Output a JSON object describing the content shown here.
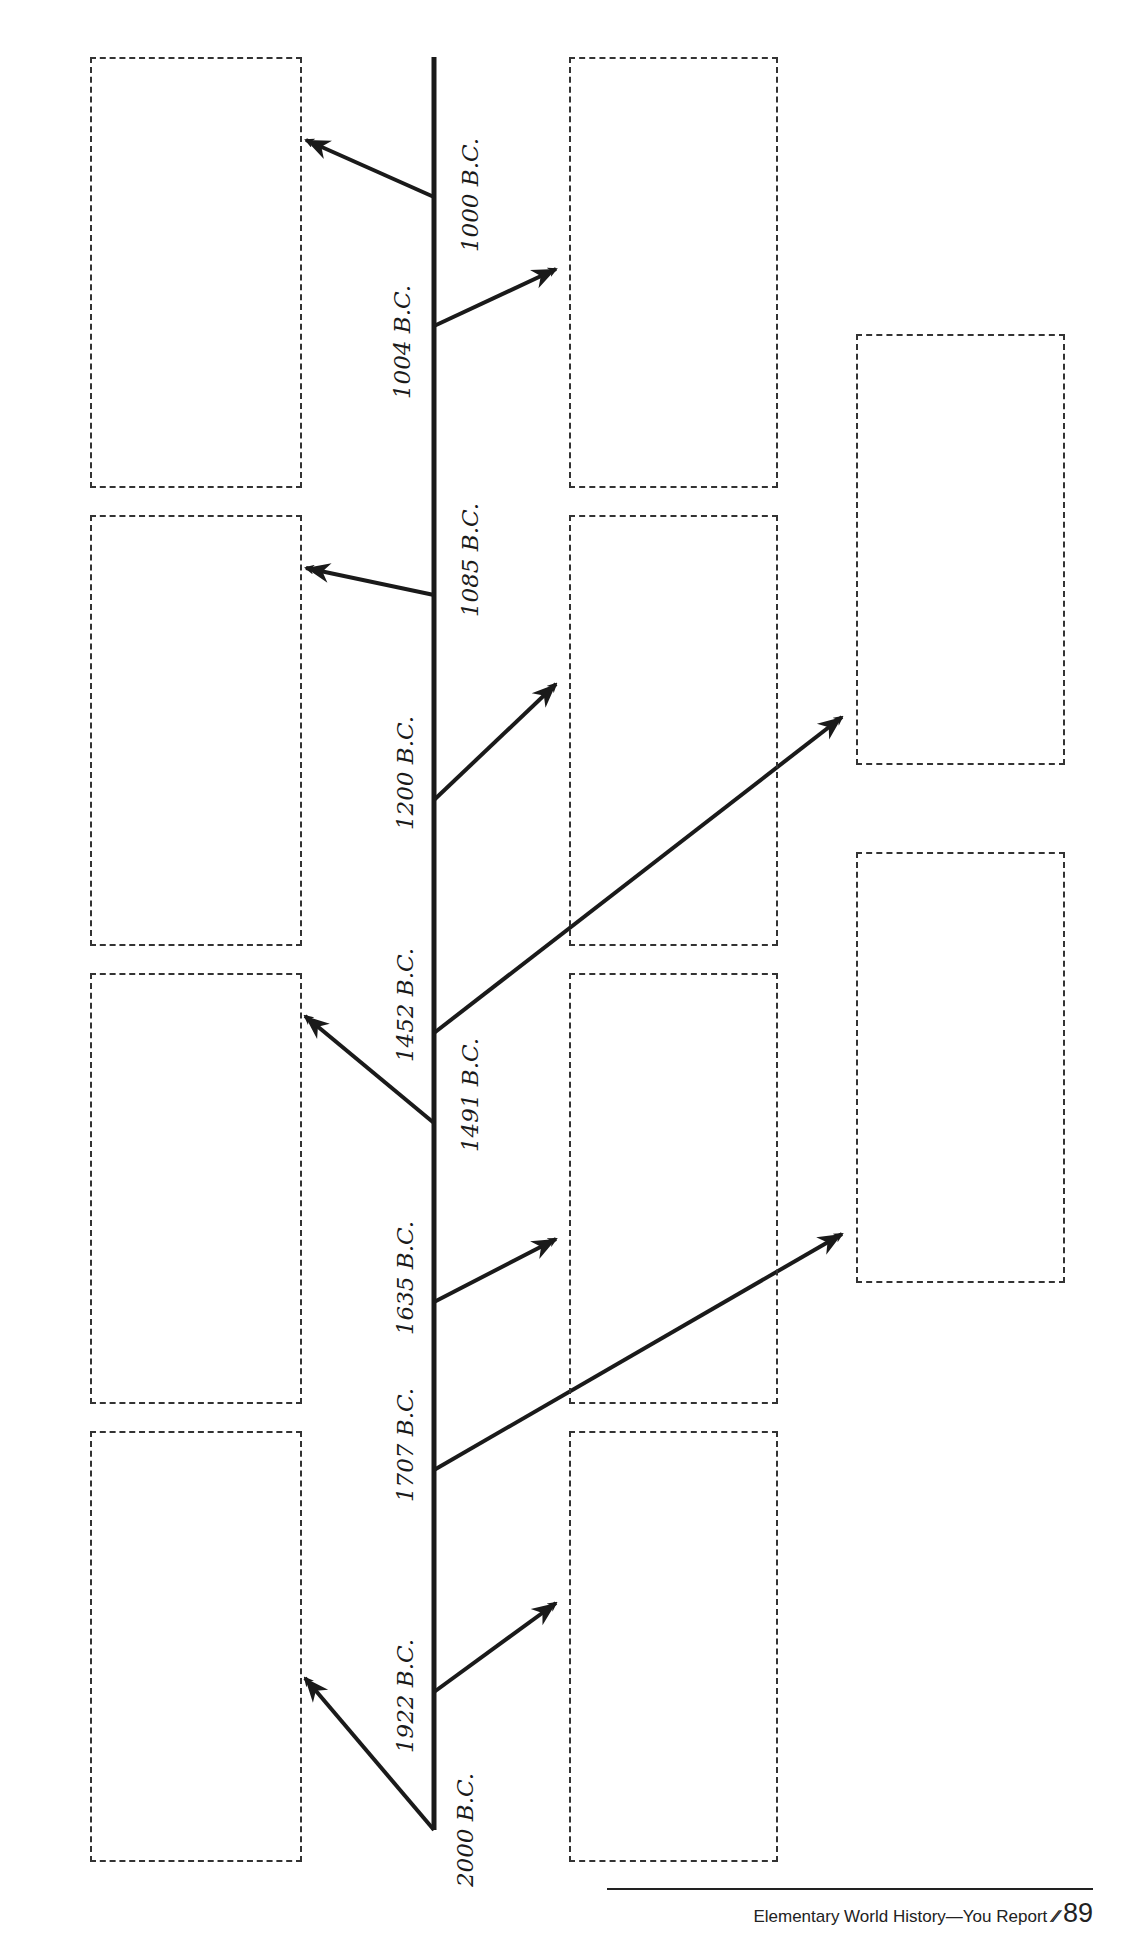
{
  "diagram": {
    "type": "vertical-timeline",
    "line_color": "#1a1a1a",
    "box_border_color": "#333333",
    "timeline": {
      "x": 434,
      "y_top": 57,
      "y_bottom": 1830
    },
    "boxes": [
      {
        "id": "left-1",
        "x": 90,
        "y": 57,
        "w": 212,
        "h": 431
      },
      {
        "id": "left-2",
        "x": 90,
        "y": 515,
        "w": 212,
        "h": 431
      },
      {
        "id": "left-3",
        "x": 90,
        "y": 973,
        "w": 212,
        "h": 431
      },
      {
        "id": "left-4",
        "x": 90,
        "y": 1431,
        "w": 212,
        "h": 431
      },
      {
        "id": "middle-1",
        "x": 569,
        "y": 57,
        "w": 209,
        "h": 431
      },
      {
        "id": "middle-2",
        "x": 569,
        "y": 515,
        "w": 209,
        "h": 431
      },
      {
        "id": "middle-3",
        "x": 569,
        "y": 973,
        "w": 209,
        "h": 431
      },
      {
        "id": "middle-4",
        "x": 569,
        "y": 1431,
        "w": 209,
        "h": 431
      },
      {
        "id": "right-1",
        "x": 856,
        "y": 334,
        "w": 209,
        "h": 431
      },
      {
        "id": "right-2",
        "x": 856,
        "y": 852,
        "w": 209,
        "h": 431
      }
    ],
    "events": [
      {
        "label": "1000 B.C.",
        "label_x": 470,
        "label_y": 195,
        "branch": {
          "x1": 434,
          "y1": 197,
          "x2": 306,
          "y2": 140
        }
      },
      {
        "label": "1004 B.C.",
        "label_x": 402,
        "label_y": 342,
        "branch": {
          "x1": 434,
          "y1": 326,
          "x2": 556,
          "y2": 269
        }
      },
      {
        "label": "1085 B.C.",
        "label_x": 470,
        "label_y": 560,
        "branch": {
          "x1": 434,
          "y1": 595,
          "x2": 306,
          "y2": 568
        }
      },
      {
        "label": "1200 B.C.",
        "label_x": 405,
        "label_y": 773,
        "branch": {
          "x1": 434,
          "y1": 800,
          "x2": 556,
          "y2": 684
        }
      },
      {
        "label": "1452 B.C.",
        "label_x": 405,
        "label_y": 1005,
        "branch": {
          "x1": 434,
          "y1": 1033,
          "x2": 842,
          "y2": 717
        }
      },
      {
        "label": "1491 B.C.",
        "label_x": 470,
        "label_y": 1095,
        "branch": {
          "x1": 434,
          "y1": 1123,
          "x2": 305,
          "y2": 1016
        }
      },
      {
        "label": "1635 B.C.",
        "label_x": 405,
        "label_y": 1278,
        "branch": {
          "x1": 434,
          "y1": 1302,
          "x2": 556,
          "y2": 1239
        }
      },
      {
        "label": "1707 B.C.",
        "label_x": 405,
        "label_y": 1445,
        "branch": {
          "x1": 434,
          "y1": 1470,
          "x2": 842,
          "y2": 1234
        }
      },
      {
        "label": "1922 B.C.",
        "label_x": 405,
        "label_y": 1696,
        "branch": {
          "x1": 434,
          "y1": 1692,
          "x2": 556,
          "y2": 1603
        }
      },
      {
        "label": "2000 B.C.",
        "label_x": 465,
        "label_y": 1830,
        "branch": {
          "x1": 434,
          "y1": 1830,
          "x2": 305,
          "y2": 1678
        }
      }
    ]
  },
  "footer": {
    "title": "Elementary World History—You Report",
    "marks": "∕∕",
    "page_number": "89"
  }
}
